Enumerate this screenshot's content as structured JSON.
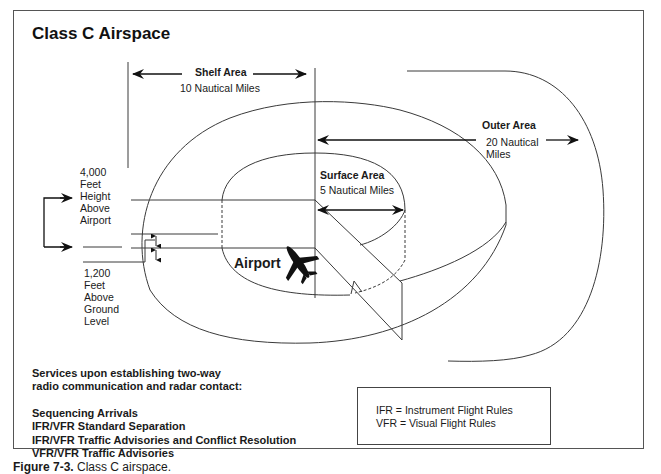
{
  "title": "Class C Airspace",
  "areas": {
    "shelf": {
      "label": "Shelf Area",
      "distance": "10 Nautical Miles"
    },
    "outer": {
      "label": "Outer Area",
      "distance_line1": "20  Nautical",
      "distance_line2": "Miles"
    },
    "surface": {
      "label": "Surface Area",
      "distance": "5 Nautical Miles"
    }
  },
  "altitudes": {
    "upper": [
      "4,000",
      "Feet",
      "Height",
      "Above",
      "Airport"
    ],
    "lower": [
      "1,200",
      "Feet",
      "Above",
      "Ground",
      "Level"
    ]
  },
  "airport_label": "Airport",
  "services": {
    "intro_line1": "Services upon establishing two-way",
    "intro_line2": "radio communication and radar contact:",
    "items": [
      "Sequencing Arrivals",
      "IFR/VFR Standard Separation",
      "IFR/VFR Traffic Advisories and Conflict Resolution",
      "VFR/VFR Traffic Advisories"
    ]
  },
  "legend": {
    "ifr": "IFR = Instrument Flight Rules",
    "vfr": "VFR = Visual Flight Rules"
  },
  "caption": {
    "number": "Figure 7-3.",
    "text": "Class C airspace."
  },
  "colors": {
    "line": "#3a3a3a",
    "text": "#1a1a1a",
    "background": "#ffffff"
  }
}
